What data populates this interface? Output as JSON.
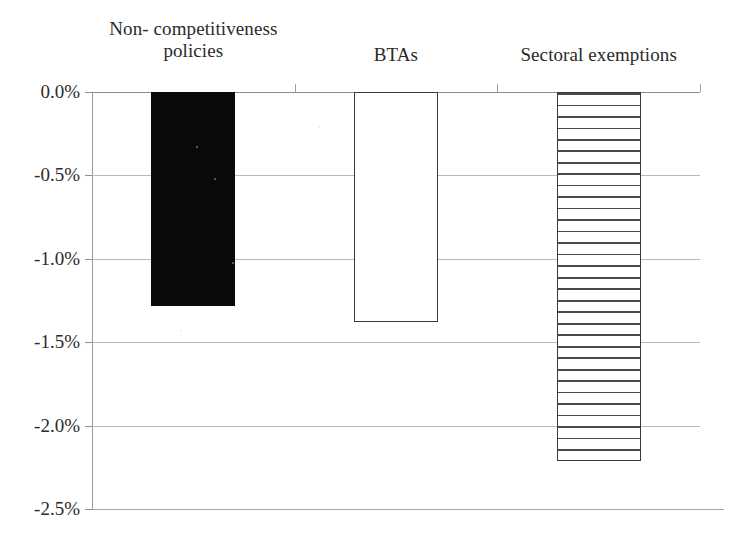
{
  "chart_data": {
    "type": "bar",
    "title": "",
    "subtitle": "",
    "xlabel": "",
    "ylabel": "",
    "categories": [
      "Non- competitiveness\npolicies",
      "BTAs",
      "Sectoral exemptions"
    ],
    "values": [
      -1.28,
      -1.38,
      -2.21
    ],
    "value_labels": [
      "-1.28%",
      "-1.38%",
      "-2.21%"
    ],
    "series": [
      {
        "name": "",
        "values": [
          -1.28,
          -1.38,
          -2.21
        ]
      }
    ],
    "ylim": [
      -2.5,
      0.0
    ],
    "ytick_values": [
      0.0,
      -0.5,
      -1.0,
      -1.5,
      -2.0,
      -2.5
    ],
    "ytick_labels": [
      "0.0%",
      "-0.5%",
      "-1.0%",
      "-1.5%",
      "-2.0%",
      "-2.5%"
    ],
    "grid": true,
    "legend": "none",
    "orientation": "vertical",
    "bar_styles": [
      "solid-black",
      "white-outline",
      "horizontal-hatch"
    ],
    "colors": {
      "bar_solid": "#0a0a0a",
      "bar_hollow_fill": "#ffffff",
      "bar_outline": "#3a3a3a",
      "hatch_line": "#4a4a4a",
      "gridline": "#b9b9b9",
      "axis": "#8f8f8f",
      "text": "#2b2b2b",
      "background": "#ffffff"
    }
  }
}
